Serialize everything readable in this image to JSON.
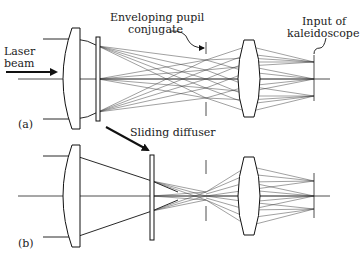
{
  "figure": {
    "panel_a": {
      "label": "(a)",
      "laser_label_line1": "Laser",
      "laser_label_line2": "beam",
      "pupil_label_line1": "Enveloping pupil",
      "pupil_label_line2": "conjugate",
      "kaleido_label_line1": "Input of",
      "kaleido_label_line2": "kaleidoscope"
    },
    "panel_b": {
      "label": "(b)",
      "diffuser_label": "Sliding diffuser"
    }
  },
  "colors": {
    "ink": "#111111",
    "background": "#ffffff"
  }
}
